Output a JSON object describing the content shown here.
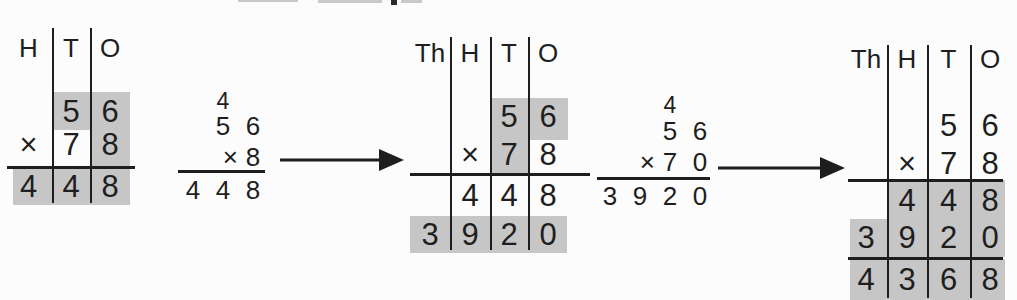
{
  "colors": {
    "highlight": "#c6c6c6",
    "ink": "#1e1e1e",
    "paper": "#fcfcfc"
  },
  "chart1": {
    "headers": [
      "H",
      "T",
      "O"
    ],
    "rows": {
      "top": [
        "",
        "5",
        "6"
      ],
      "mult": [
        "×",
        "7",
        "8"
      ],
      "result": [
        "4",
        "4",
        "8"
      ]
    }
  },
  "work1": {
    "carry": "4",
    "top": [
      "",
      "5",
      "6"
    ],
    "mult": [
      "",
      "×",
      "8"
    ],
    "result": [
      "4",
      "4",
      "8"
    ]
  },
  "chart2": {
    "headers": [
      "Th",
      "H",
      "T",
      "O"
    ],
    "rows": {
      "top": [
        "",
        "",
        "5",
        "6"
      ],
      "mult": [
        "",
        "×",
        "7",
        "8"
      ],
      "partial1": [
        "",
        "4",
        "4",
        "8"
      ],
      "partial2": [
        "3",
        "9",
        "2",
        "0"
      ]
    }
  },
  "work2": {
    "carry": "4",
    "top": [
      "",
      "",
      "5",
      "6"
    ],
    "mult": [
      "",
      "×",
      "7",
      "0"
    ],
    "result": [
      "3",
      "9",
      "2",
      "0"
    ]
  },
  "chart3": {
    "headers": [
      "Th",
      "H",
      "T",
      "O"
    ],
    "rows": {
      "top": [
        "",
        "",
        "5",
        "6"
      ],
      "mult": [
        "",
        "×",
        "7",
        "8"
      ],
      "partial1": [
        "",
        "4",
        "4",
        "8"
      ],
      "partial2": [
        "3",
        "9",
        "2",
        "0"
      ],
      "total": [
        "4",
        "3",
        "6",
        "8"
      ]
    }
  }
}
